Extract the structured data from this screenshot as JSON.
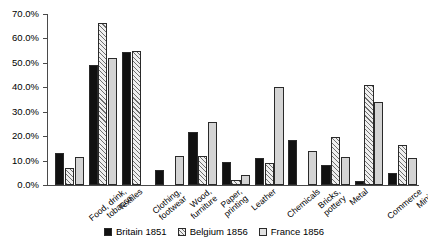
{
  "chart_data": {
    "type": "bar",
    "title": "",
    "subtitle": "",
    "xlabel": "",
    "ylabel": "",
    "ylim": [
      0,
      70
    ],
    "ytick_labels": [
      "0.0%",
      "10.0%",
      "20.0%",
      "30.0%",
      "40.0%",
      "50.0%",
      "60.0%",
      "70.0%"
    ],
    "ytick_values": [
      0,
      10,
      20,
      30,
      40,
      50,
      60,
      70
    ],
    "grid": false,
    "legend_position": "bottom-center",
    "categories": [
      "Food, drink,\ntobacco",
      "Textiles",
      "Clothing,\nfootwear",
      "Wood,\nfurniture",
      "Paper,\nprinting",
      "Leather",
      "Chemicals",
      "Bricks,\npottery",
      "Metal",
      "Commerce",
      "Mining"
    ],
    "series": [
      {
        "name": "Britain 1851",
        "color": "#111111",
        "pattern": "solid",
        "values": [
          13.0,
          49.0,
          54.5,
          6.0,
          21.5,
          9.5,
          11.0,
          18.5,
          8.0,
          1.5,
          5.0
        ]
      },
      {
        "name": "Belgium 1856",
        "color": "#efefef",
        "pattern": "diagonal-hatch",
        "values": [
          7.0,
          66.5,
          55.0,
          null,
          12.0,
          2.0,
          9.0,
          null,
          19.5,
          41.0,
          16.5
        ]
      },
      {
        "name": "France 1856",
        "color": "#d4d4d4",
        "pattern": "solid-light",
        "values": [
          11.5,
          52.0,
          null,
          12.0,
          26.0,
          4.0,
          40.0,
          14.0,
          11.5,
          34.0,
          11.0
        ]
      }
    ]
  },
  "legend": {
    "entries": [
      {
        "label": "Britain 1851"
      },
      {
        "label": "Belgium 1856"
      },
      {
        "label": "France 1856"
      }
    ]
  }
}
